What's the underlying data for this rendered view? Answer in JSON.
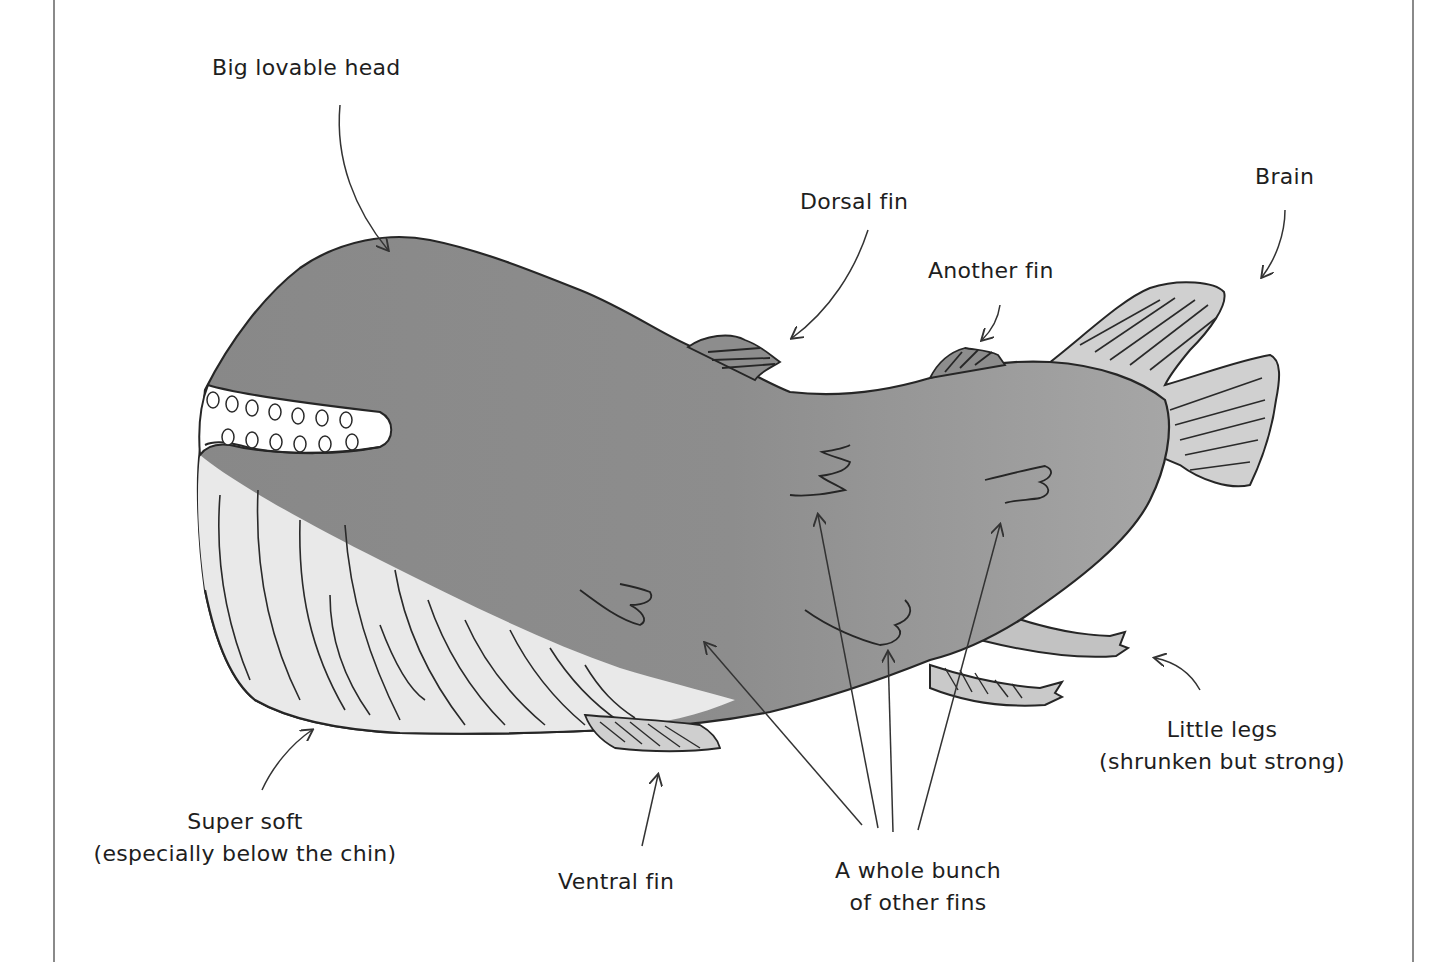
{
  "diagram": {
    "colors": {
      "body": "#8f8f8f",
      "body_light": "#a9a9a9",
      "belly": "#ececec",
      "fin": "#d2d2d2",
      "ink": "#262626",
      "frame": "#8a8a8a"
    },
    "labels": {
      "head": {
        "text": "Big lovable head"
      },
      "dorsal_fin": {
        "text": "Dorsal fin"
      },
      "another_fin": {
        "text": "Another fin"
      },
      "brain": {
        "text": "Brain"
      },
      "legs": {
        "line1": "Little legs",
        "line2": "(shrunken but strong)"
      },
      "soft": {
        "line1": "Super soft",
        "line2": "(especially below the chin)"
      },
      "ventral_fin": {
        "text": "Ventral fin"
      },
      "other_fins": {
        "line1": "A whole bunch",
        "line2": "of other fins"
      }
    }
  }
}
